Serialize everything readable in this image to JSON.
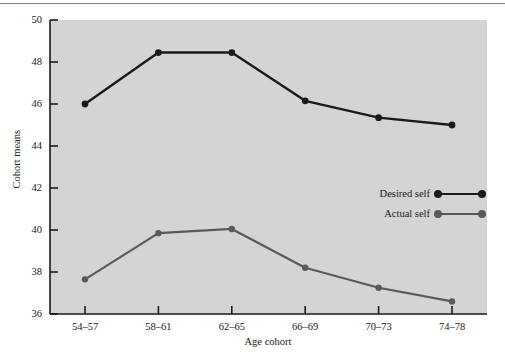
{
  "figure": {
    "background_color": "#ffffff",
    "plot_background_color": "#d4d4d4",
    "top_rule_color": "#7a7a7a"
  },
  "chart_data": {
    "type": "line",
    "title": "",
    "xlabel": "Age cohort",
    "ylabel": "Cohort means",
    "categories": [
      "54–57",
      "58–61",
      "62–65",
      "66–69",
      "70–73",
      "74–78"
    ],
    "ylim": [
      36,
      50
    ],
    "yticks": [
      36,
      38,
      40,
      42,
      44,
      46,
      48,
      50
    ],
    "ytick_labels": [
      "36",
      "38",
      "40",
      "42",
      "44",
      "46",
      "48",
      "50"
    ],
    "grid": false,
    "legend_position": "center-right",
    "series": [
      {
        "name": "Desired self",
        "color": "#1a1a1a",
        "marker": "circle",
        "values": [
          46.0,
          48.45,
          48.45,
          46.15,
          45.35,
          45.0
        ]
      },
      {
        "name": "Actual self",
        "color": "#595959",
        "marker": "circle",
        "values": [
          37.65,
          39.85,
          40.05,
          38.2,
          37.25,
          36.6
        ]
      }
    ]
  }
}
